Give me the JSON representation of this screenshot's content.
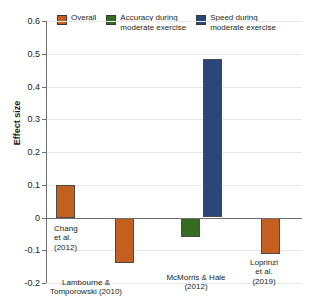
{
  "chart_data": {
    "type": "bar",
    "title": "",
    "xlabel": "",
    "ylabel": "Effect size",
    "ylim": [
      -0.2,
      0.6
    ],
    "ytick_labels": [
      "0.6",
      "0.5",
      "0.4",
      "0.3",
      "0.2",
      "0.1",
      "0",
      "-0.1",
      "-0.2"
    ],
    "ytick_values": [
      0.6,
      0.5,
      0.4,
      0.3,
      0.2,
      0.1,
      0,
      -0.1,
      -0.2
    ],
    "grid": true,
    "legend_position": "top",
    "categories": [
      "Chang et al. (2012)",
      "Lambourne & Tomporowski (2010)",
      "McMorris & Hale (2012)",
      "McMorris & Hale (2012)",
      "Loprinzi et al. (2019)"
    ],
    "bars": [
      {
        "study": "Chang\net al.\n(2012)",
        "series": "Overall",
        "value": 0.1,
        "color": "#C4601F"
      },
      {
        "study": "Lambourne &\nTomporowski (2010)",
        "series": "Overall",
        "value": -0.14,
        "color": "#C4601F"
      },
      {
        "study": "",
        "series": "Accuracy during moderate exercise",
        "value": -0.06,
        "color": "#366B22"
      },
      {
        "study": "McMorris & Hale\n(2012)",
        "series": "Speed during moderate exercise",
        "value": 0.485,
        "color": "#2B4779"
      },
      {
        "study": "Loprinzi\net al.\n(2019)",
        "series": "Overall",
        "value": -0.11,
        "color": "#C4601F"
      }
    ],
    "series": [
      {
        "name": "Overall",
        "color": "#C4601F",
        "values": [
          0.1,
          -0.14,
          null,
          null,
          -0.11
        ]
      },
      {
        "name": "Accuracy during moderate exercise",
        "color": "#366B22",
        "values": [
          null,
          null,
          -0.06,
          null,
          null
        ]
      },
      {
        "name": "Speed during moderate exercise",
        "color": "#2B4779",
        "values": [
          null,
          null,
          null,
          0.485,
          null
        ]
      }
    ]
  },
  "legend": {
    "items": [
      {
        "label": "Overall",
        "color": "#C4601F"
      },
      {
        "label": "Accuracy during\nmoderate exercise",
        "color": "#366B22"
      },
      {
        "label": "Speed during\nmoderate exercise",
        "color": "#2B4779"
      }
    ]
  },
  "axis": {
    "y_title": "Effect size"
  }
}
